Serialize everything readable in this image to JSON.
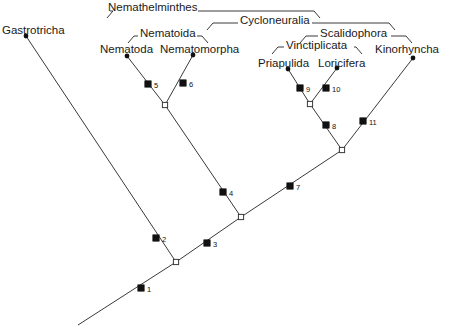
{
  "figure": {
    "type": "phylogenetic-cladogram",
    "background_color": "#ffffff",
    "line_color": "#3a3a3a",
    "text_color": "#1a1a1a",
    "width": 451,
    "height": 336
  },
  "taxa": [
    {
      "name": "Gastrotricha",
      "label_x": 2,
      "label_y": 25,
      "tip_x": 26,
      "tip_y": 36
    },
    {
      "name": "Nematoda",
      "label_x": 100,
      "label_y": 44,
      "tip_x": 127,
      "tip_y": 56
    },
    {
      "name": "Nematomorpha",
      "label_x": 160,
      "label_y": 44,
      "tip_x": 193,
      "tip_y": 55
    },
    {
      "name": "Priapulida",
      "label_x": 258,
      "label_y": 58,
      "tip_x": 288,
      "tip_y": 69
    },
    {
      "name": "Loricifera",
      "label_x": 318,
      "label_y": 58,
      "tip_x": 337,
      "tip_y": 68
    },
    {
      "name": "Kinorhyncha",
      "label_x": 375,
      "label_y": 44,
      "tip_x": 413,
      "tip_y": 58
    }
  ],
  "clades": [
    {
      "name": "Nemathelminthes",
      "label_x": 108,
      "label_y": 2,
      "bracket_left": 107,
      "bracket_right": 320,
      "bracket_y": 11,
      "text_gap_left": 110,
      "text_gap_right": 198
    },
    {
      "name": "Cycloneuralia",
      "label_x": 240,
      "label_y": 15,
      "bracket_left": 207,
      "bracket_right": 395,
      "bracket_y": 23,
      "text_gap_left": 238,
      "text_gap_right": 312
    },
    {
      "name": "Nematoida",
      "label_x": 140,
      "label_y": 28,
      "bracket_left": 128,
      "bracket_right": 208,
      "bracket_y": 36,
      "text_gap_left": 138,
      "text_gap_right": 197
    },
    {
      "name": "Scalidophora",
      "label_x": 320,
      "label_y": 28,
      "bracket_left": 300,
      "bracket_right": 412,
      "bracket_y": 36,
      "text_gap_left": 318,
      "text_gap_right": 391
    },
    {
      "name": "Vinctiplicata",
      "label_x": 286,
      "label_y": 40,
      "bracket_left": 272,
      "bracket_right": 362,
      "bracket_y": 47,
      "text_gap_left": 284,
      "text_gap_right": 354
    }
  ],
  "branches": [
    {
      "id": "root-stem",
      "x1": 78,
      "y1": 325,
      "x2": 176,
      "y2": 262
    },
    {
      "id": "basal-to-gastrotricha",
      "x1": 176,
      "y1": 262,
      "x2": 26,
      "y2": 36
    },
    {
      "id": "basal-to-nemathel",
      "x1": 176,
      "y1": 262,
      "x2": 241,
      "y2": 217
    },
    {
      "id": "nemathel-to-nematoida",
      "x1": 241,
      "y1": 217,
      "x2": 165,
      "y2": 105
    },
    {
      "id": "nemathel-to-cyclo",
      "x1": 241,
      "y1": 217,
      "x2": 342,
      "y2": 150
    },
    {
      "id": "nematoida-to-nematoda",
      "x1": 165,
      "y1": 105,
      "x2": 127,
      "y2": 56
    },
    {
      "id": "nematoida-to-nematom",
      "x1": 165,
      "y1": 105,
      "x2": 193,
      "y2": 55
    },
    {
      "id": "cyclo-to-vinctiplicata",
      "x1": 342,
      "y1": 150,
      "x2": 310,
      "y2": 104
    },
    {
      "id": "cyclo-to-kinorhyncha",
      "x1": 342,
      "y1": 150,
      "x2": 413,
      "y2": 58
    },
    {
      "id": "vinct-to-priapulida",
      "x1": 310,
      "y1": 104,
      "x2": 288,
      "y2": 69
    },
    {
      "id": "vinct-to-loricifera",
      "x1": 310,
      "y1": 104,
      "x2": 337,
      "y2": 68
    }
  ],
  "internal_nodes": [
    {
      "id": "node-basal",
      "x": 176,
      "y": 262,
      "style": "open"
    },
    {
      "id": "node-nemathel",
      "x": 241,
      "y": 217,
      "style": "open"
    },
    {
      "id": "node-nematoida",
      "x": 165,
      "y": 105,
      "style": "open"
    },
    {
      "id": "node-cycloneuralia",
      "x": 342,
      "y": 150,
      "style": "open"
    },
    {
      "id": "node-vinctiplicata",
      "x": 310,
      "y": 104,
      "style": "open"
    }
  ],
  "character_marks": [
    {
      "number": "1",
      "x": 141,
      "y": 288,
      "style": "filled",
      "label_dx": 6,
      "label_dy": 1
    },
    {
      "number": "2",
      "x": 156,
      "y": 238,
      "style": "filled",
      "label_dx": 6,
      "label_dy": 1
    },
    {
      "number": "3",
      "x": 207,
      "y": 243,
      "style": "filled",
      "label_dx": 6,
      "label_dy": 1
    },
    {
      "number": "4",
      "x": 223,
      "y": 192,
      "style": "filled",
      "label_dx": 6,
      "label_dy": 1
    },
    {
      "number": "5",
      "x": 148,
      "y": 84,
      "style": "filled",
      "label_dx": 6,
      "label_dy": 1
    },
    {
      "number": "6",
      "x": 183,
      "y": 83,
      "style": "filled",
      "label_dx": 6,
      "label_dy": 1
    },
    {
      "number": "7",
      "x": 290,
      "y": 186,
      "style": "filled",
      "label_dx": 6,
      "label_dy": 1
    },
    {
      "number": "8",
      "x": 326,
      "y": 125,
      "style": "filled",
      "label_dx": 6,
      "label_dy": 1
    },
    {
      "number": "9",
      "x": 300,
      "y": 88,
      "style": "filled",
      "label_dx": 6,
      "label_dy": 1
    },
    {
      "number": "10",
      "x": 326,
      "y": 88,
      "style": "filled",
      "label_dx": 6,
      "label_dy": 1
    },
    {
      "number": "11",
      "x": 363,
      "y": 121,
      "style": "filled",
      "label_dx": 6,
      "label_dy": 1
    }
  ]
}
